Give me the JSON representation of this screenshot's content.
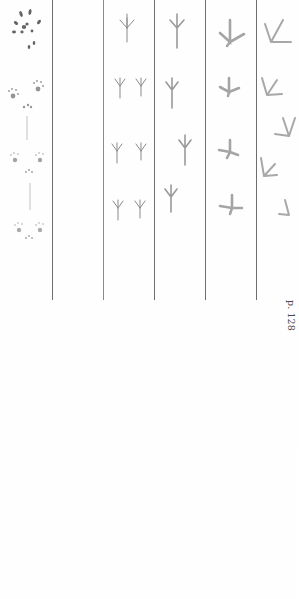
{
  "page": {
    "background": "#fefefe",
    "divider_color": "#6e6e6e",
    "track_color_light": "#9a9a9a",
    "track_color_dark": "#4a4a4a"
  },
  "columns": [
    {
      "id": "dusky-shrew",
      "name": "Dusky Shrew",
      "page": "p. 114",
      "track_type": "mammal-paw"
    },
    {
      "id": "blank",
      "name": "",
      "page": "",
      "track_type": "none"
    },
    {
      "id": "dark-eyed-junco",
      "name": "Dark-eyed Junco",
      "page": "p. 120",
      "track_type": "small-bird-hopping"
    },
    {
      "id": "common-raven",
      "name": "Common Raven",
      "page": "p. 122",
      "track_type": "bird-walking"
    },
    {
      "id": "ruffed-grouse",
      "name": "Ruffed Grouse",
      "page": "p. 124",
      "track_type": "gamebird-walking"
    },
    {
      "id": "canada-goose",
      "name": "Canada Goose",
      "page": "p. 128",
      "track_type": "webbed-walking"
    }
  ]
}
